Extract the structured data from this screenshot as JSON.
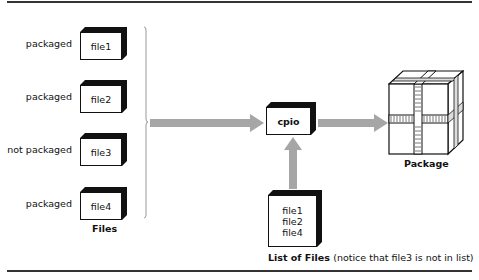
{
  "files": [
    {
      "label": "packaged",
      "name": "file1"
    },
    {
      "label": "packaged",
      "name": "file2"
    },
    {
      "label": "not packaged",
      "name": "file3"
    },
    {
      "label": "packaged",
      "name": "file4"
    }
  ],
  "files_caption": "Files",
  "process": {
    "name": "cpio"
  },
  "file_list": {
    "items": [
      "file1",
      "file2",
      "file4"
    ],
    "caption_bold": "List of Files",
    "caption_note": "(notice that file3 is not in list)"
  },
  "output": {
    "caption": "Package"
  },
  "colors": {
    "arrow": "#a6a6a6",
    "rule": "#333333",
    "box_edge": "#111111"
  }
}
